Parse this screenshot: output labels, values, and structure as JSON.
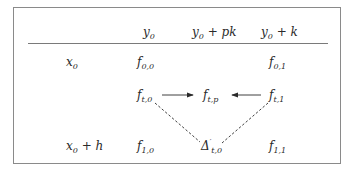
{
  "header": {
    "col1": {
      "base": "y",
      "sub": "0",
      "suffix": "",
      "label": "y0"
    },
    "col2": {
      "base": "y",
      "sub": "0",
      "suffix": " + pk",
      "label": "y0 + pk"
    },
    "col3": {
      "base": "y",
      "sub": "0",
      "suffix": " + k",
      "label": "y0 + k"
    }
  },
  "rows": [
    {
      "label": {
        "base": "x",
        "sub": "0",
        "suffix": ""
      },
      "left": {
        "base": "f",
        "sub": "0,0"
      },
      "right": {
        "base": "f",
        "sub": "0,1"
      }
    },
    {
      "label": {
        "base": "",
        "sub": "",
        "suffix": ""
      },
      "left": {
        "base": "f",
        "sub": "t,0"
      },
      "middle": {
        "base": "f",
        "sub": "t,p"
      },
      "right": {
        "base": "f",
        "sub": "t,1"
      }
    },
    {
      "label": {
        "base": "x",
        "sub": "0",
        "suffix": " + h"
      },
      "left": {
        "base": "f",
        "sub": "1,0"
      },
      "middle": {
        "base": "Δ",
        "prime": "′",
        "sub": "t,0"
      },
      "right": {
        "base": "f",
        "sub": "1,1"
      }
    }
  ],
  "edges": [
    {
      "from": "f_t,0",
      "to": "f_t,p",
      "style": "solid-arrow"
    },
    {
      "from": "f_t,1",
      "to": "f_t,p",
      "style": "solid-arrow"
    },
    {
      "from": "f_t,0",
      "to": "Δ'_t,0",
      "style": "dashed"
    },
    {
      "from": "f_t,1",
      "to": "Δ'_t,0",
      "style": "dashed"
    }
  ],
  "colors": {
    "ink": "#2a2a2a",
    "frame": "#8a8a8a"
  }
}
